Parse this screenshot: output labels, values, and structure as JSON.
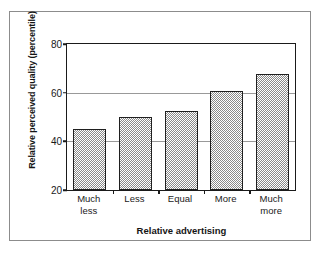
{
  "chart_data": {
    "type": "bar",
    "title": "",
    "xlabel": "Relative advertising",
    "ylabel": "Relative perceived quality (percentile)",
    "categories": [
      "Much less",
      "Less",
      "Equal",
      "More",
      "Much more"
    ],
    "category_lines": [
      [
        "Much",
        "less"
      ],
      [
        "Less"
      ],
      [
        "Equal"
      ],
      [
        "More"
      ],
      [
        "Much",
        "more"
      ]
    ],
    "values": [
      45,
      50,
      52.5,
      60.5,
      67.5
    ],
    "ylim": [
      20,
      80
    ],
    "yticks": [
      20,
      40,
      60,
      80
    ],
    "ytick_labels": [
      "20",
      "40",
      "60",
      "80"
    ],
    "gridlines": [
      40,
      60
    ],
    "grid": true,
    "legend": "none",
    "bar_fill": "checkerboard-gray",
    "colors": {
      "bar_fill": "#8a8a8a",
      "bar_border": "#1f1f1f",
      "axis": "#1a1a1a",
      "gridline": "#999999",
      "frame": "#8c8c8c",
      "text": "#1a1a1a",
      "background": "#ffffff"
    }
  }
}
